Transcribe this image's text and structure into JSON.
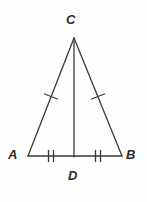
{
  "figure": {
    "name": "isosceles-triangle-with-altitude",
    "background_color": "#fefefe",
    "stroke_color": "#3a3a3a",
    "label_color": "#2b2b2b",
    "stroke_width": 1.3
  },
  "labels": {
    "apex": "C",
    "left_base": "A",
    "right_base": "B",
    "foot": "D"
  },
  "points": {
    "C": {
      "x": 74,
      "y": 38
    },
    "A": {
      "x": 28,
      "y": 156
    },
    "B": {
      "x": 122,
      "y": 156
    },
    "D": {
      "x": 74,
      "y": 156
    }
  },
  "segments": [
    {
      "name": "leg-AC",
      "from": "A",
      "to": "C",
      "ticks": 1
    },
    {
      "name": "leg-BC",
      "from": "B",
      "to": "C",
      "ticks": 1
    },
    {
      "name": "base-AD",
      "from": "A",
      "to": "D",
      "ticks": 2
    },
    {
      "name": "base-DB",
      "from": "D",
      "to": "B",
      "ticks": 2
    },
    {
      "name": "altitude-CD",
      "from": "C",
      "to": "D",
      "ticks": 0
    }
  ],
  "tick_marks": {
    "leg_left": {
      "cx": 51,
      "cy": 97
    },
    "leg_right": {
      "cx": 98,
      "cy": 97
    },
    "base_left": {
      "cx": 51,
      "cy": 156,
      "offsets": [
        -2.5,
        2.5
      ]
    },
    "base_right": {
      "cx": 98,
      "cy": 156,
      "offsets": [
        -2.5,
        2.5
      ]
    }
  }
}
